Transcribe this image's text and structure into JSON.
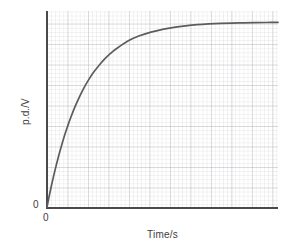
{
  "figure": {
    "background_color": "#ffffff",
    "axis_color": "#4a4a4a",
    "curve_color": "#5c5c5c",
    "grid_color": "#aaaab4"
  },
  "chart_data": {
    "type": "line",
    "title": "",
    "subtitle": "",
    "xlabel": "Time/s",
    "ylabel": "p.d./V",
    "x_origin_label": "0",
    "y_origin_label": "0",
    "grid": true,
    "legend": false,
    "legend_position": "none",
    "xlim": [
      0,
      10
    ],
    "ylim": [
      0,
      1.06
    ],
    "xticks": [],
    "yticks": [],
    "xticklabels": [],
    "yticklabels": [],
    "annotations": [],
    "series": [
      {
        "name": "p.d. across capacitor",
        "color": "#5c5c5c",
        "model": "V = V0 * (1 - exp(-t/tau))",
        "V0": 1.0,
        "tau": 1.55,
        "x": [
          0.0,
          0.1,
          0.2,
          0.3,
          0.4,
          0.5,
          0.6,
          0.7,
          0.8,
          0.9,
          1.0,
          1.2,
          1.4,
          1.6,
          1.8,
          2.0,
          2.25,
          2.5,
          2.75,
          3.0,
          3.5,
          4.0,
          4.5,
          5.0,
          5.5,
          6.0,
          6.5,
          7.0,
          7.5,
          8.0,
          8.5,
          9.0,
          9.5,
          10.0
        ],
        "y": [
          0.0,
          0.063,
          0.121,
          0.176,
          0.227,
          0.275,
          0.32,
          0.363,
          0.403,
          0.44,
          0.475,
          0.539,
          0.595,
          0.645,
          0.688,
          0.726,
          0.766,
          0.801,
          0.831,
          0.856,
          0.898,
          0.926,
          0.946,
          0.961,
          0.972,
          0.98,
          0.986,
          0.99,
          0.993,
          0.995,
          0.996,
          0.997,
          0.998,
          0.999
        ]
      }
    ]
  }
}
